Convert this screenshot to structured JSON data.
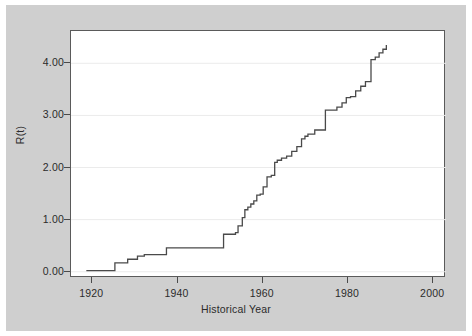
{
  "figure": {
    "background_color": "#cfcfcf",
    "panel_color": "#ffffff",
    "frame_color": "#5a5a5a",
    "grid_color": "#ebebeb",
    "line_color": "#4a4a4a"
  },
  "chart_data": {
    "type": "line",
    "title": "",
    "subtitle": "",
    "xlabel": "Historical Year",
    "ylabel": "R(t)",
    "xlim": [
      1915,
      2003
    ],
    "ylim": [
      -0.12,
      4.62
    ],
    "xticks": [
      1920,
      1940,
      1960,
      1980,
      2000
    ],
    "xtick_labels": [
      "1920",
      "1940",
      "1960",
      "1980",
      "2000"
    ],
    "yticks": [
      0.0,
      1.0,
      2.0,
      3.0,
      4.0
    ],
    "ytick_labels": [
      "0.00",
      "1.00",
      "2.00",
      "3.00",
      "4.00"
    ],
    "grid": "horizontal",
    "legend": "none",
    "annotations": [],
    "step_style": "post",
    "series": [
      {
        "name": "R(t)",
        "x": [
          1918.6,
          1925.0,
          1925.3,
          1928.3,
          1930.6,
          1932.2,
          1937.0,
          1937.4,
          1950.4,
          1950.8,
          1953.6,
          1954.2,
          1955.2,
          1955.8,
          1956.5,
          1957.2,
          1957.9,
          1958.6,
          1959.4,
          1960.1,
          1961.0,
          1962.0,
          1962.8,
          1963.4,
          1964.4,
          1965.6,
          1966.8,
          1968.0,
          1969.1,
          1969.9,
          1970.6,
          1972.2,
          1974.2,
          1974.7,
          1977.4,
          1978.6,
          1979.6,
          1980.6,
          1981.8,
          1983.0,
          1984.1,
          1985.0,
          1985.4,
          1986.4,
          1987.3,
          1988.2,
          1989.0
        ],
        "y": [
          0.02,
          0.02,
          0.17,
          0.24,
          0.3,
          0.33,
          0.33,
          0.46,
          0.46,
          0.72,
          0.75,
          0.88,
          1.04,
          1.19,
          1.24,
          1.3,
          1.36,
          1.47,
          1.49,
          1.63,
          1.82,
          1.85,
          2.1,
          2.14,
          2.18,
          2.22,
          2.31,
          2.4,
          2.55,
          2.6,
          2.64,
          2.72,
          2.72,
          3.1,
          3.16,
          3.24,
          3.34,
          3.36,
          3.47,
          3.56,
          3.65,
          3.65,
          4.07,
          4.12,
          4.2,
          4.27,
          4.35
        ]
      }
    ]
  }
}
